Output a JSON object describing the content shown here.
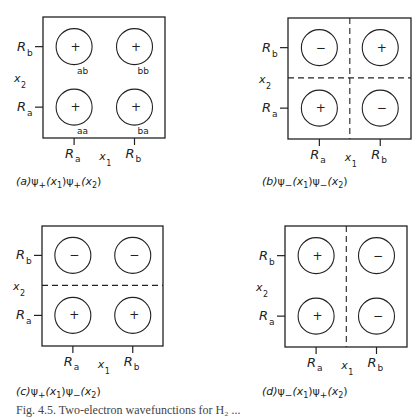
{
  "panels": [
    {
      "id": "a",
      "caption_tag": "(a)",
      "caption_formula": "ψ+(x1)ψ+(x2)",
      "caption_parts": {
        "f1": "ψ",
        "s1": "+",
        "a1": "(x",
        "i1": "1",
        "b1": ")",
        "f2": "ψ",
        "s2": "+",
        "a2": "(x",
        "i2": "2",
        "b2": ")"
      },
      "signs": {
        "aa": "+",
        "ab": "+",
        "ba": "+",
        "bb": "+"
      },
      "region_labels": {
        "aa": "aa",
        "ab": "ab",
        "ba": "ba",
        "bb": "bb"
      },
      "nodal_vertical": false,
      "nodal_horizontal": false
    },
    {
      "id": "b",
      "caption_tag": "(b)",
      "caption_formula": "ψ−(x1)ψ−(x2)",
      "caption_parts": {
        "f1": "ψ",
        "s1": "−",
        "a1": "(x",
        "i1": "1",
        "b1": ")",
        "f2": "ψ",
        "s2": "−",
        "a2": "(x",
        "i2": "2",
        "b2": ")"
      },
      "signs": {
        "aa": "+",
        "ab": "−",
        "ba": "−",
        "bb": "+"
      },
      "nodal_vertical": true,
      "nodal_horizontal": true
    },
    {
      "id": "c",
      "caption_tag": "(c)",
      "caption_formula": "ψ+(x1)ψ−(x2)",
      "caption_parts": {
        "f1": "ψ",
        "s1": "+",
        "a1": "(x",
        "i1": "1",
        "b1": ")",
        "f2": "ψ",
        "s2": "−",
        "a2": "(x",
        "i2": "2",
        "b2": ")"
      },
      "signs": {
        "aa": "+",
        "ab": "−",
        "ba": "+",
        "bb": "−"
      },
      "nodal_vertical": false,
      "nodal_horizontal": true
    },
    {
      "id": "d",
      "caption_tag": "(d)",
      "caption_formula": "ψ−(x1)ψ+(x2)",
      "caption_parts": {
        "f1": "ψ",
        "s1": "−",
        "a1": "(x",
        "i1": "1",
        "b1": ")",
        "f2": "ψ",
        "s2": "+",
        "a2": "(x",
        "i2": "2",
        "b2": ")"
      },
      "signs": {
        "aa": "+",
        "ab": "+",
        "ba": "−",
        "bb": "−"
      },
      "nodal_vertical": true,
      "nodal_horizontal": false
    }
  ],
  "axes": {
    "x_axis_label": "x",
    "x_axis_sub": "1",
    "y_axis_label": "x",
    "y_axis_sub": "2",
    "tick_a": "R",
    "tick_a_sub": "a",
    "tick_b": "R",
    "tick_b_sub": "b"
  },
  "figure_caption": "Fig. 4.5. Two-electron wavefunctions for H₂ ..."
}
